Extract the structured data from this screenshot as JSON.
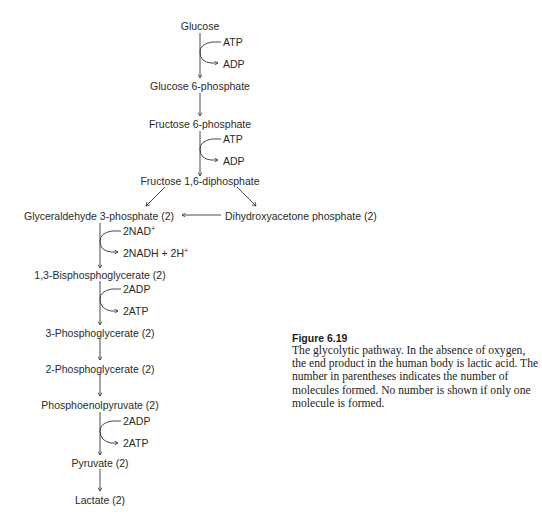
{
  "pathway": {
    "nodes": [
      {
        "id": "glucose",
        "label": "Glucose"
      },
      {
        "id": "g6p",
        "label": "Glucose 6-phosphate"
      },
      {
        "id": "f6p",
        "label": "Fructose 6-phosphate"
      },
      {
        "id": "f16dp",
        "label": "Fructose 1,6-diphosphate"
      },
      {
        "id": "g3p",
        "label": "Glyceraldehyde 3-phosphate (2)"
      },
      {
        "id": "dhap",
        "label": "Dihydroxyacetone phosphate (2)"
      },
      {
        "id": "bpg",
        "label": "1,3-Bisphosphoglycerate (2)"
      },
      {
        "id": "pg3",
        "label": "3-Phosphoglycerate (2)"
      },
      {
        "id": "pg2",
        "label": "2-Phosphoglycerate (2)"
      },
      {
        "id": "pep",
        "label": "Phosphoenolpyruvate (2)"
      },
      {
        "id": "pyruvate",
        "label": "Pyruvate (2)"
      },
      {
        "id": "lactate",
        "label": "Lactate (2)"
      }
    ],
    "cofactors": [
      {
        "step": "glucose-to-g6p",
        "in": "ATP",
        "out": "ADP"
      },
      {
        "step": "f6p-to-f16dp",
        "in": "ATP",
        "out": "ADP"
      },
      {
        "step": "g3p-to-bpg",
        "in": "2NAD",
        "in_sup": "+",
        "out": "2NADH + 2H",
        "out_sup": "+"
      },
      {
        "step": "bpg-to-pg3",
        "in": "2ADP",
        "out": "2ATP"
      },
      {
        "step": "pep-to-pyruvate",
        "in": "2ADP",
        "out": "2ATP"
      }
    ]
  },
  "caption": {
    "title": "Figure 6.19",
    "text": "The glycolytic pathway. In the absence of oxygen, the end product in the human body is lactic acid. The number in parentheses indicates the number of molecules formed. No number is shown if only one molecule is formed."
  }
}
